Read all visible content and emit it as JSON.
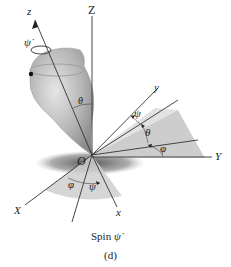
{
  "figure": {
    "caption": "(d)",
    "subtitle": "Spin ψ̇",
    "subtitle_word": "Spin",
    "subtitle_symbol": "ψ̇"
  },
  "axes": {
    "fixed": {
      "X": "X",
      "Y": "Y",
      "Z": "Z"
    },
    "body": {
      "x": "x",
      "y": "y",
      "z": "z"
    },
    "origin": "O"
  },
  "angles": {
    "theta_top": "θ",
    "psi_right": "ψ",
    "theta_right": "θ",
    "phi_right": "φ",
    "phi_bottom": "φ",
    "psi_bottom": "ψ",
    "psi_dot_top": "ψ̇"
  },
  "colors": {
    "line": "#333333",
    "shade_light": "#d9d9d9",
    "shade_dark": "#bdbdbd",
    "top_body": "#b8b8b8"
  }
}
